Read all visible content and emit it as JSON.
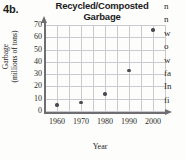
{
  "problem_label": "4b.",
  "axis_label_year": "Year",
  "y_axis_title_line1": "Garbage",
  "y_axis_title_line2": "(millions of tons)",
  "title_line1": "Recycled/Composted",
  "title_line2": "Garbage",
  "colors": {
    "point": "#4a4a52",
    "grid": "#c9c9cf",
    "axis": "#6e6e72",
    "text": "#1b1b1b",
    "background": "#fdfdfb"
  },
  "bleed_text": {
    "lines": [
      "n",
      "n",
      "w",
      "o",
      "w",
      "fa",
      "In",
      "fi"
    ]
  },
  "chart_data": {
    "type": "scatter",
    "title": "Recycled/Composted Garbage",
    "xlabel": "Year",
    "ylabel": "Garbage (millions of tons)",
    "x": [
      1960,
      1970,
      1980,
      1990,
      2000
    ],
    "values": [
      5,
      7,
      14,
      33,
      66
    ],
    "xtick_labels": [
      "1960",
      "1970",
      "1980",
      "1990",
      "2000"
    ],
    "ytick_labels": [
      "0",
      "10",
      "20",
      "30",
      "40",
      "50",
      "60",
      "70"
    ],
    "yticks": [
      0,
      10,
      20,
      30,
      40,
      50,
      60,
      70
    ],
    "xlim": [
      1955,
      2005
    ],
    "ylim": [
      0,
      70
    ],
    "grid": true,
    "legend": false
  }
}
